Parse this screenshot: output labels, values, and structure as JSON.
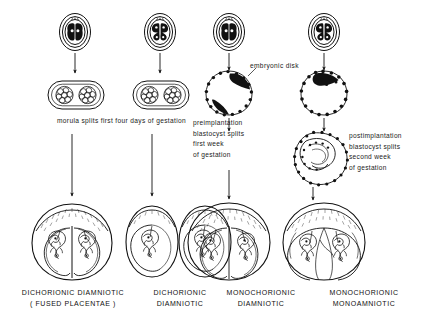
{
  "figure": {
    "type": "embryology-diagram",
    "labels": {
      "embryonic_disk": "embryonic disk",
      "morula_caption": "morula splits first four days of gestation",
      "preimplantation": {
        "line1": "preimplantation",
        "line2": "blastocyst splits",
        "line3": "first week",
        "line4": "of gestation"
      },
      "postimplantation": {
        "line1": "postimplantation",
        "line2": "blastocyst splits",
        "line3": "second week",
        "line4": "of gestation"
      }
    },
    "outcomes": [
      {
        "line1": "DICHORIONIC  DIAMNIOTIC",
        "line2": "( FUSED PLACENTAE )"
      },
      {
        "line1": "DICHORIONIC",
        "line2": "DIAMNIOTIC"
      },
      {
        "line1": "MONOCHORIONIC",
        "line2": "DIAMNIOTIC"
      },
      {
        "line1": "MONOCHORIONIC",
        "line2": "MONOAMNIOTIC"
      }
    ],
    "columns": [
      {
        "name": "column-1-dichorionic-fused",
        "stages": [
          "two-cell zygote in zona pellucida",
          "two morulae within shared zona",
          "twin gestation with fused placentae"
        ]
      },
      {
        "name": "column-2-dichorionic-separate",
        "stages": [
          "two-cell zygote in zona pellucida",
          "two morulae within shared zona",
          "two separate gestational sacs"
        ]
      },
      {
        "name": "column-3-monochorionic-diamniotic",
        "stages": [
          "two-cell zygote in zona pellucida",
          "blastocyst with two embryonic disks",
          "single chorion with two amnions"
        ]
      },
      {
        "name": "column-4-monochorionic-monoamniotic",
        "stages": [
          "two-cell zygote in zona pellucida",
          "blastocyst with one embryonic disk",
          "implanted blastocyst splitting",
          "single chorion and single amnion"
        ]
      }
    ],
    "colors": {
      "ink": "#111111",
      "background": "#ffffff"
    }
  }
}
